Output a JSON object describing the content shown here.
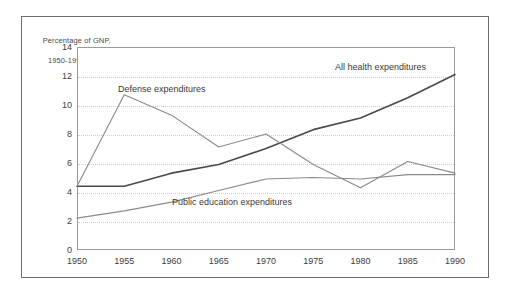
{
  "figure": {
    "caption_line1": "Percentage of GNP,",
    "caption_line2": "1950-1990"
  },
  "chart_data": {
    "type": "line",
    "title": "Percentage of GNP, 1950-1990",
    "xlabel": "",
    "ylabel": "",
    "x": [
      1950,
      1955,
      1960,
      1965,
      1970,
      1975,
      1980,
      1985,
      1990
    ],
    "xtick_labels": [
      "1950",
      "1955",
      "1960",
      "1965",
      "1970",
      "1975",
      "1980",
      "1985",
      "1990"
    ],
    "ytick_labels": [
      "0",
      "2",
      "4",
      "6",
      "8",
      "10",
      "12",
      "14"
    ],
    "yticks": [
      0,
      2,
      4,
      6,
      8,
      10,
      12,
      14
    ],
    "xlim": [
      1950,
      1990
    ],
    "ylim": [
      0,
      14
    ],
    "grid": "horizontal-dotted",
    "legend_position": "inline-annotations",
    "series": [
      {
        "name": "All health expenditures",
        "label": "All health expenditures",
        "color": "#4a4a4a",
        "width": 1.6,
        "values": [
          4.4,
          4.4,
          5.3,
          5.9,
          7.0,
          8.3,
          9.1,
          10.5,
          12.1
        ]
      },
      {
        "name": "Defense expenditures",
        "label": "Defense expenditures",
        "color": "#8a8a8a",
        "width": 1.1,
        "values": [
          4.4,
          10.7,
          9.3,
          7.1,
          8.0,
          5.9,
          4.3,
          6.1,
          5.3
        ]
      },
      {
        "name": "Public education expenditures",
        "label": "Public education expenditures",
        "color": "#8a8a8a",
        "width": 1.1,
        "values": [
          2.2,
          2.7,
          3.3,
          4.1,
          4.9,
          5.0,
          4.9,
          5.2,
          5.2
        ]
      }
    ]
  }
}
